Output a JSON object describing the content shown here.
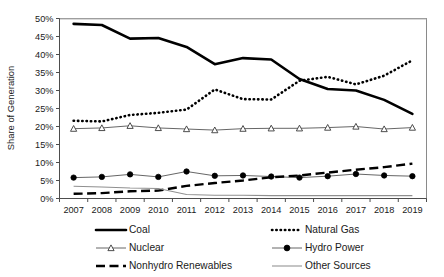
{
  "chart_data": {
    "type": "line",
    "title": "",
    "xlabel": "",
    "ylabel": "Share of Generation",
    "ylim": [
      0,
      50
    ],
    "ytick_labels": [
      "50%",
      "45%",
      "40%",
      "35%",
      "30%",
      "25%",
      "20%",
      "15%",
      "10%",
      "5%",
      "0%"
    ],
    "ytick_values": [
      50,
      45,
      40,
      35,
      30,
      25,
      20,
      15,
      10,
      5,
      0
    ],
    "grid": false,
    "legend_position": "bottom",
    "x": [
      2007,
      2008,
      2009,
      2010,
      2011,
      2012,
      2013,
      2014,
      2015,
      2016,
      2017,
      2018,
      2019
    ],
    "categories": [
      "2007",
      "2008",
      "2009",
      "2010",
      "2011",
      "2012",
      "2013",
      "2014",
      "2015",
      "2016",
      "2017",
      "2018",
      "2019"
    ],
    "series": [
      {
        "name": "Coal",
        "style": "thick-solid",
        "marker": "none",
        "color": "#000000",
        "values": [
          48.5,
          48.2,
          44.4,
          44.6,
          42.1,
          37.3,
          39.0,
          38.6,
          33.2,
          30.4,
          30.0,
          27.4,
          23.5
        ]
      },
      {
        "name": "Natural Gas",
        "style": "dotted",
        "marker": "none",
        "color": "#000000",
        "values": [
          21.6,
          21.4,
          23.2,
          23.8,
          24.7,
          30.3,
          27.6,
          27.5,
          32.7,
          33.8,
          31.7,
          34.1,
          38.4
        ]
      },
      {
        "name": "Nuclear",
        "style": "thin-solid",
        "marker": "triangle-open",
        "color": "#555555",
        "values": [
          19.4,
          19.6,
          20.2,
          19.6,
          19.3,
          19.0,
          19.4,
          19.5,
          19.5,
          19.7,
          20.0,
          19.3,
          19.7
        ]
      },
      {
        "name": "Hydro Power",
        "style": "thin-solid",
        "marker": "circle-filled",
        "color": "#555555",
        "values": [
          5.8,
          6.0,
          6.7,
          6.0,
          7.5,
          6.3,
          6.4,
          6.1,
          5.8,
          6.2,
          6.8,
          6.4,
          6.2
        ]
      },
      {
        "name": "Nonhydro Renewables",
        "style": "dashed",
        "marker": "none",
        "color": "#000000",
        "values": [
          1.3,
          1.5,
          2.0,
          2.2,
          3.5,
          4.3,
          5.0,
          5.9,
          6.4,
          7.2,
          8.0,
          8.7,
          9.7
        ]
      },
      {
        "name": "Other Sources",
        "style": "thin-solid-gray",
        "marker": "none",
        "color": "#8f8f8f",
        "values": [
          3.4,
          3.2,
          2.9,
          2.8,
          1.1,
          0.9,
          0.9,
          0.8,
          0.8,
          0.8,
          0.8,
          0.8,
          0.8
        ]
      }
    ],
    "legend": [
      {
        "label": "Coal",
        "style": "thick-solid",
        "marker": "none"
      },
      {
        "label": "Natural Gas",
        "style": "dotted",
        "marker": "none"
      },
      {
        "label": "Nuclear",
        "style": "thin-solid",
        "marker": "triangle-open"
      },
      {
        "label": "Hydro Power",
        "style": "thin-solid",
        "marker": "circle-filled"
      },
      {
        "label": "Nonhydro Renewables",
        "style": "dashed",
        "marker": "none"
      },
      {
        "label": "Other Sources",
        "style": "thin-solid-gray",
        "marker": "none"
      }
    ]
  }
}
